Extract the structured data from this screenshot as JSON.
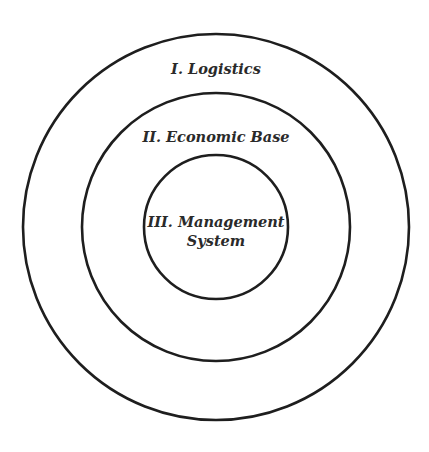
{
  "diagram": {
    "type": "concentric-circles",
    "center": {
      "x": 216,
      "y": 227
    },
    "stroke_color": "#1e1e1e",
    "text_color": "#2a2a2a",
    "rings": [
      {
        "level": 1,
        "radius": 193,
        "label": "I. Logistics",
        "label_y": 74
      },
      {
        "level": 2,
        "radius": 134,
        "label": "II. Economic Base",
        "label_y": 142
      },
      {
        "level": 3,
        "radius": 72,
        "label_lines": [
          "III. Management",
          "System"
        ],
        "label_y": [
          227,
          246
        ]
      }
    ]
  }
}
